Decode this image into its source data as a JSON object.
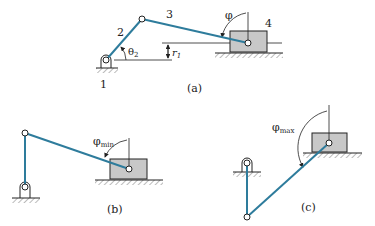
{
  "figure_a": {
    "caption": "(a)",
    "labels": {
      "ground": "1",
      "crank": "2",
      "coupler": "3",
      "slider": "4",
      "theta": "θ",
      "theta_sub": "2",
      "offset": "r",
      "offset_sub": "1",
      "angle": "φ"
    }
  },
  "figure_b": {
    "caption": "(b)",
    "labels": {
      "angle": "φ",
      "angle_sub": "min"
    }
  },
  "figure_c": {
    "caption": "(c)",
    "labels": {
      "angle": "φ",
      "angle_sub": "max"
    }
  },
  "colors": {
    "link": "#2e7c9c",
    "slider_fill": "#c8c8c8",
    "line": "#222222"
  }
}
